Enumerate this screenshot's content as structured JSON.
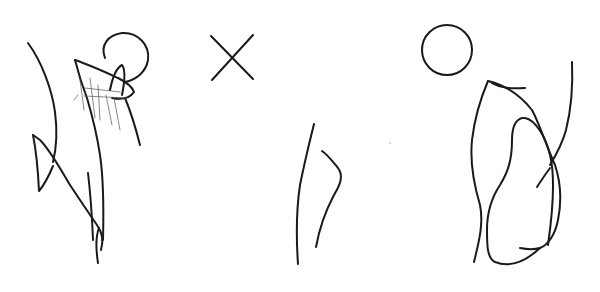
{
  "image": {
    "background": "#ffffff",
    "stroke_color": "#1a1a1a",
    "panels": [
      {
        "name": "figure-sketch",
        "description": "scribbled figure with head"
      },
      {
        "name": "cross-and-lines",
        "description": "X mark above two vertical strokes"
      },
      {
        "name": "circle-and-loop",
        "description": "circle above looped elongated shape"
      }
    ]
  }
}
